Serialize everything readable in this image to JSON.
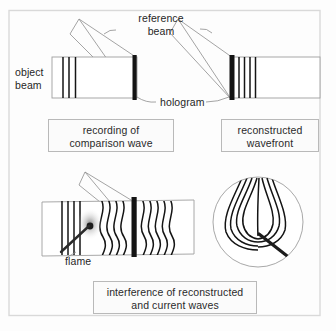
{
  "figure": {
    "background_color": "#fdfdfd",
    "frame_color": "#d8d8d8",
    "ink_color": "#1a1a1a",
    "caption_border_color": "#b9b9b9"
  },
  "labels": {
    "reference_beam": "reference\nbeam",
    "object_beam": "object\nbeam",
    "hologram": "hologram",
    "flame": "flame"
  },
  "captions": {
    "recording": "recording of\ncomparison wave",
    "reconstructed": "reconstructed\nwavefront",
    "interference": "interference of reconstructed\nand current waves"
  },
  "panels": [
    {
      "name": "recording-of-comparison-wave",
      "caption": "recording of comparison wave",
      "beam_box": {
        "x": 52,
        "y": 57,
        "width": 85,
        "height": 41
      },
      "hologram_plate": {
        "x": 133,
        "y": 55,
        "width": 4,
        "height": 45
      },
      "wave_lines": 3,
      "wave_line_x": [
        63,
        69,
        75
      ],
      "reference_beam_apex": {
        "x": 79,
        "y": 19
      }
    },
    {
      "name": "reconstructed-wavefront",
      "caption": "reconstructed wavefront",
      "beam_box": {
        "x": 232,
        "y": 57,
        "width": 88,
        "height": 41
      },
      "hologram_plate": {
        "x": 230,
        "y": 55,
        "width": 5,
        "height": 45
      },
      "wave_lines": 4,
      "wave_line_x": [
        239,
        244,
        249,
        254
      ],
      "reference_beam_apex": {
        "x": 178,
        "y": 19
      }
    },
    {
      "name": "interference-of-reconstructed-and-current-waves",
      "caption": "interference of reconstructed and current waves",
      "beam_box": {
        "x": 42,
        "y": 201,
        "width": 152,
        "height": 54
      },
      "hologram_plate": {
        "x": 132,
        "y": 198,
        "width": 5,
        "height": 60
      },
      "flame_tip": {
        "x": 90,
        "y": 224
      },
      "reference_beam_apex": {
        "x": 85,
        "y": 172
      },
      "inset_circle": {
        "cx": 258,
        "cy": 222,
        "r": 45
      }
    }
  ],
  "chart_data": {
    "type": "diagram",
    "annotations": [
      "reference beam",
      "object beam",
      "hologram",
      "flame",
      "recording of comparison wave",
      "reconstructed wavefront",
      "interference of reconstructed and current waves"
    ]
  }
}
